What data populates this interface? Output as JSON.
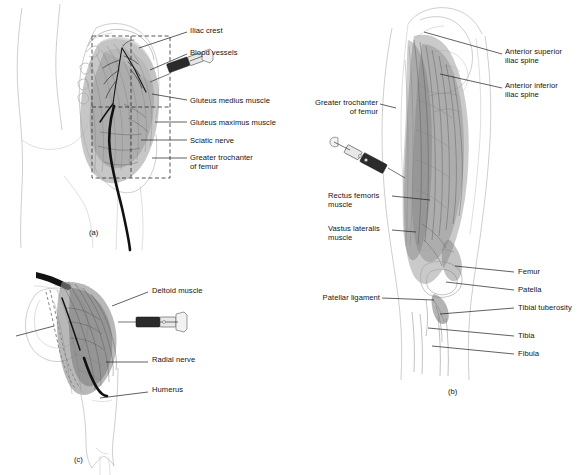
{
  "figure": {
    "colors": {
      "line": "#1c1c1c",
      "skin_outline": "#b9b9b9",
      "muscle_mid": "#9a9a9a",
      "muscle_dark": "#5d5d5d",
      "nerve": "#111111",
      "syringe_barrel": "#2b2b2b",
      "background": "#ffffff"
    }
  },
  "panels": [
    {
      "id": "a",
      "caption": "(a)",
      "site": "dorsogluteal",
      "labels": [
        {
          "text": "Iliac crest",
          "x": 190,
          "y": 30
        },
        {
          "text": "Blood vessels",
          "x": 190,
          "y": 52
        },
        {
          "text": "Gluteus medius muscle",
          "x": 190,
          "y": 100
        },
        {
          "text": "Gluteus maximus muscle",
          "x": 190,
          "y": 122
        },
        {
          "text": "Sciatic nerve",
          "x": 190,
          "y": 140
        },
        {
          "text": "Greater trochanter\nof femur",
          "x": 190,
          "y": 157
        }
      ]
    },
    {
      "id": "b",
      "caption": "(b)",
      "site": "vastus lateralis / rectus femoris",
      "labels_right": [
        {
          "text": "Anterior superior\niliac spine",
          "x": 205,
          "y": 52
        },
        {
          "text": "Anterior inferior\niliac spine",
          "x": 205,
          "y": 85
        },
        {
          "text": "Femur",
          "x": 218,
          "y": 271
        },
        {
          "text": "Patella",
          "x": 218,
          "y": 289
        },
        {
          "text": "Tibial tuberosity",
          "x": 218,
          "y": 307
        },
        {
          "text": "Tibia",
          "x": 218,
          "y": 335
        },
        {
          "text": "Fibula",
          "x": 218,
          "y": 353
        }
      ],
      "labels_left": [
        {
          "text": "Greater trochanter\nof femur",
          "x": 12,
          "y": 103
        },
        {
          "text": "Rectus femoris\nmuscle",
          "x": 28,
          "y": 195
        },
        {
          "text": "Vastus lateralis\nmuscle",
          "x": 28,
          "y": 228
        },
        {
          "text": "Patellar ligament",
          "x": 14,
          "y": 297
        }
      ]
    },
    {
      "id": "c",
      "caption": "(c)",
      "site": "deltoid",
      "labels": [
        {
          "text": "Deltoid muscle",
          "x": 152,
          "y": 40
        },
        {
          "text": "Radial nerve",
          "x": 152,
          "y": 108
        },
        {
          "text": "Humerus",
          "x": 152,
          "y": 138
        }
      ]
    }
  ]
}
